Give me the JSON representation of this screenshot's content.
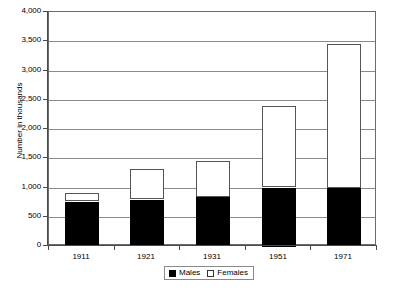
{
  "chart_data": {
    "type": "bar",
    "subtype": "stacked-vertical",
    "title": "",
    "xlabel": "",
    "ylabel": "Number in thousands",
    "categories": [
      "1911",
      "1921",
      "1931",
      "1951",
      "1971"
    ],
    "series": [
      {
        "name": "Males",
        "color": "#000000",
        "values": [
          760,
          790,
          835,
          1000,
          990
        ]
      },
      {
        "name": "Females",
        "color": "#ffffff",
        "values": [
          145,
          520,
          615,
          1390,
          2455
        ]
      }
    ],
    "totals": [
      905,
      1310,
      1450,
      2390,
      3445
    ],
    "ylim": [
      0,
      4000
    ],
    "ytick_values": [
      0,
      500,
      1000,
      1500,
      2000,
      2500,
      3000,
      3500,
      4000
    ],
    "ytick_labels": [
      "0",
      "500",
      "1,000",
      "1,500",
      "2,000",
      "2,500",
      "3,000",
      "3,500",
      "4,000"
    ],
    "grid": true,
    "grid_axis": "y",
    "legend_position": "bottom-center",
    "legend_entries": [
      "Males",
      "Females"
    ]
  },
  "legend": {
    "males_label": "Males",
    "females_label": "Females"
  },
  "axes": {
    "y_title": "Number in thousands"
  }
}
